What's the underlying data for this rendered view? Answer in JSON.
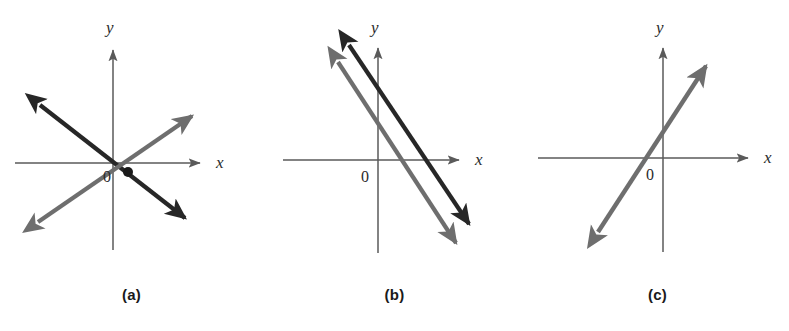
{
  "figure": {
    "width": 789,
    "height": 331,
    "background": "#ffffff"
  },
  "colors": {
    "axis": "#5a5a5a",
    "dark_line": "#272727",
    "gray_line": "#6e6e6e",
    "label": "#2b2b2b",
    "caption": "#1a1a1a",
    "intersection_dot": "#1a1a1a"
  },
  "labels": {
    "x_axis": "x",
    "y_axis": "y",
    "origin": "0"
  },
  "panels": [
    {
      "id": "a",
      "caption": "(a)",
      "left": 0,
      "description": "two intersecting lines with one solution",
      "axes": {
        "x_axis": {
          "x1": 15,
          "y1": 163,
          "x2": 200,
          "y2": 163,
          "arrow": "right"
        },
        "y_axis": {
          "x1": 113,
          "y1": 250,
          "x2": 113,
          "y2": 50,
          "arrow": "up"
        },
        "x_label_pos": {
          "x": 216,
          "y": 168
        },
        "y_label_pos": {
          "x": 106,
          "y": 33
        },
        "origin_label_pos": {
          "x": 112,
          "y": 180
        }
      },
      "lines": [
        {
          "name": "dark-line",
          "color": "#272727",
          "width": 4.2,
          "x1": 40,
          "y1": 105,
          "x2": 185,
          "y2": 218,
          "arrows": "both"
        },
        {
          "name": "gray-line",
          "color": "#6e6e6e",
          "width": 4.2,
          "x1": 38,
          "y1": 222,
          "x2": 192,
          "y2": 116,
          "arrows": "both"
        }
      ],
      "intersection": {
        "x": 128,
        "y": 172,
        "r": 5,
        "visible": true
      }
    },
    {
      "id": "b",
      "caption": "(b)",
      "left": 263,
      "description": "two parallel lines with no solution",
      "axes": {
        "x_axis": {
          "x1": 20,
          "y1": 160,
          "x2": 196,
          "y2": 160,
          "arrow": "right"
        },
        "y_axis": {
          "x1": 115,
          "y1": 253,
          "x2": 115,
          "y2": 48,
          "arrow": "up"
        },
        "x_label_pos": {
          "x": 212,
          "y": 165
        },
        "y_label_pos": {
          "x": 108,
          "y": 31
        },
        "origin_label_pos": {
          "x": 100,
          "y": 180
        }
      },
      "lines": [
        {
          "name": "dark-line",
          "color": "#272727",
          "width": 4.2,
          "x1": 86,
          "y1": 45,
          "x2": 206,
          "y2": 224,
          "arrows": "both"
        },
        {
          "name": "gray-line",
          "color": "#6e6e6e",
          "width": 4.2,
          "x1": 75,
          "y1": 62,
          "x2": 193,
          "y2": 243,
          "arrows": "both"
        }
      ],
      "intersection": {
        "visible": false
      }
    },
    {
      "id": "c",
      "caption": "(c)",
      "left": 526,
      "description": "two coincident lines with infinitely many solutions",
      "axes": {
        "x_axis": {
          "x1": 12,
          "y1": 158,
          "x2": 222,
          "y2": 158,
          "arrow": "right"
        },
        "y_axis": {
          "x1": 137,
          "y1": 252,
          "x2": 137,
          "y2": 48,
          "arrow": "up"
        },
        "x_label_pos": {
          "x": 238,
          "y": 163
        },
        "y_label_pos": {
          "x": 130,
          "y": 31
        },
        "origin_label_pos": {
          "x": 128,
          "y": 178
        }
      },
      "lines": [
        {
          "name": "coincident-line",
          "color": "#6e6e6e",
          "width": 4.4,
          "x1": 72,
          "y1": 232,
          "x2": 180,
          "y2": 66,
          "arrows": "both"
        }
      ],
      "intersection": {
        "visible": false
      }
    }
  ]
}
